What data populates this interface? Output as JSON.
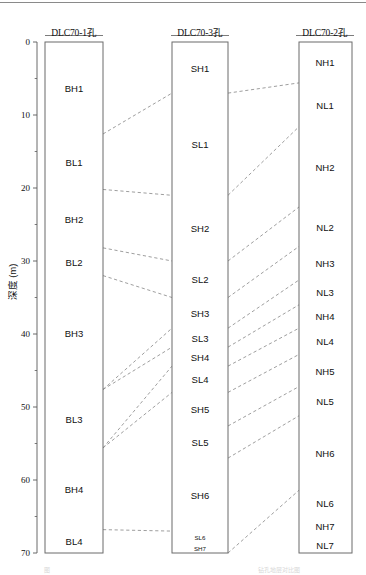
{
  "figure": {
    "title_fragment_left": "图",
    "title_fragment_right": "钻孔地层对比图",
    "axis_title": "深度 (m)",
    "line_color": "#5a5a5a",
    "box_color": "#6b6b6b",
    "dash_color": "#8c8c8c"
  },
  "axis": {
    "label": "深度 (m)",
    "min": 0,
    "max": 70,
    "major_ticks": [
      0,
      10,
      20,
      30,
      40,
      50,
      60,
      70
    ],
    "major_labels": [
      "0",
      "10",
      "20",
      "30",
      "40",
      "50",
      "60",
      "70"
    ],
    "minor_ticks": [
      5,
      15,
      25,
      35,
      45,
      55,
      65
    ]
  },
  "columns": [
    {
      "id": "dlc70-1",
      "header": "DLC70-1孔",
      "top_depth": 0,
      "bottom_depth": 70,
      "units": [
        {
          "name": "BH1",
          "top": 0.0,
          "bottom": 12.6
        },
        {
          "name": "BL1",
          "top": 12.6,
          "bottom": 20.2
        },
        {
          "name": "BH2",
          "top": 20.2,
          "bottom": 28.2
        },
        {
          "name": "BL2",
          "top": 28.2,
          "bottom": 32.0
        },
        {
          "name": "BH3",
          "top": 32.0,
          "bottom": 47.6
        },
        {
          "name": "BL3",
          "top": 47.6,
          "bottom": 55.6
        },
        {
          "name": "BH4",
          "top": 55.6,
          "bottom": 66.8
        },
        {
          "name": "BL4",
          "top": 66.8,
          "bottom": 70.0
        }
      ]
    },
    {
      "id": "dlc70-3",
      "header": "DLC70-3孔",
      "top_depth": 0,
      "bottom_depth": 70,
      "units": [
        {
          "name": "SH1",
          "top": 0.0,
          "bottom": 7.0
        },
        {
          "name": "SL1",
          "top": 7.0,
          "bottom": 21.0
        },
        {
          "name": "SH2",
          "top": 21.0,
          "bottom": 30.0
        },
        {
          "name": "SL2",
          "top": 30.0,
          "bottom": 35.0
        },
        {
          "name": "SH3",
          "top": 35.0,
          "bottom": 39.2
        },
        {
          "name": "SL3",
          "top": 39.2,
          "bottom": 41.8
        },
        {
          "name": "SH4",
          "top": 41.8,
          "bottom": 44.4
        },
        {
          "name": "SL4",
          "top": 44.4,
          "bottom": 48.0
        },
        {
          "name": "SH5",
          "top": 48.0,
          "bottom": 52.6
        },
        {
          "name": "SL5",
          "top": 52.6,
          "bottom": 57.0
        },
        {
          "name": "SH6",
          "top": 57.0,
          "bottom": 67.0
        },
        {
          "name": "SL6",
          "top": 67.0,
          "bottom": 68.6,
          "small": true
        },
        {
          "name": "SH7",
          "top": 68.6,
          "bottom": 70.0,
          "small": true
        }
      ]
    },
    {
      "id": "dlc70-2",
      "header": "DLC70-2孔",
      "top_depth": 0,
      "bottom_depth": 70,
      "units": [
        {
          "name": "NH1",
          "top": 0.0,
          "bottom": 5.6
        },
        {
          "name": "NL1",
          "top": 5.6,
          "bottom": 11.6
        },
        {
          "name": "NH2",
          "top": 11.6,
          "bottom": 22.6
        },
        {
          "name": "NL2",
          "top": 22.6,
          "bottom": 28.0
        },
        {
          "name": "NH3",
          "top": 28.0,
          "bottom": 32.6
        },
        {
          "name": "NL3",
          "top": 32.6,
          "bottom": 36.0
        },
        {
          "name": "NH4",
          "top": 36.0,
          "bottom": 39.2
        },
        {
          "name": "NL4",
          "top": 39.2,
          "bottom": 42.8
        },
        {
          "name": "NH5",
          "top": 42.8,
          "bottom": 47.2
        },
        {
          "name": "NL5",
          "top": 47.2,
          "bottom": 51.2
        },
        {
          "name": "NH6",
          "top": 51.2,
          "bottom": 61.4
        },
        {
          "name": "NL6",
          "top": 61.4,
          "bottom": 64.8
        },
        {
          "name": "NH7",
          "top": 64.8,
          "bottom": 67.8
        },
        {
          "name": "NL7",
          "top": 67.8,
          "bottom": 70.0
        }
      ]
    }
  ],
  "correlations_left_mid": [
    {
      "left_depth": 12.6,
      "mid_depth": 7.0
    },
    {
      "left_depth": 20.2,
      "mid_depth": 21.0
    },
    {
      "left_depth": 28.2,
      "mid_depth": 30.0
    },
    {
      "left_depth": 32.0,
      "mid_depth": 35.0
    },
    {
      "left_depth": 47.6,
      "mid_depth": 39.2
    },
    {
      "left_depth": 47.6,
      "mid_depth": 41.8
    },
    {
      "left_depth": 55.6,
      "mid_depth": 44.4
    },
    {
      "left_depth": 55.6,
      "mid_depth": 48.0
    },
    {
      "left_depth": 66.8,
      "mid_depth": 67.0
    }
  ],
  "correlations_mid_right": [
    {
      "mid_depth": 7.0,
      "right_depth": 5.6
    },
    {
      "mid_depth": 21.0,
      "right_depth": 11.6
    },
    {
      "mid_depth": 30.0,
      "right_depth": 22.6
    },
    {
      "mid_depth": 35.0,
      "right_depth": 28.0
    },
    {
      "mid_depth": 39.2,
      "right_depth": 32.6
    },
    {
      "mid_depth": 41.8,
      "right_depth": 36.0
    },
    {
      "mid_depth": 44.4,
      "right_depth": 39.2
    },
    {
      "mid_depth": 48.0,
      "right_depth": 42.8
    },
    {
      "mid_depth": 52.6,
      "right_depth": 47.2
    },
    {
      "mid_depth": 57.0,
      "right_depth": 51.2
    },
    {
      "mid_depth": 70.0,
      "right_depth": 61.4
    }
  ],
  "chart_data": {
    "type": "table",
    "ylabel": "深度 (m)",
    "ylim": [
      0,
      70
    ],
    "grid": false,
    "legend": "none",
    "boreholes": [
      "DLC70-1孔",
      "DLC70-3孔",
      "DLC70-2孔"
    ],
    "series": [
      {
        "name": "DLC70-1孔",
        "units": [
          "BH1",
          "BL1",
          "BH2",
          "BL2",
          "BH3",
          "BL3",
          "BH4",
          "BL4"
        ],
        "tops": [
          0.0,
          12.6,
          20.2,
          28.2,
          32.0,
          47.6,
          55.6,
          66.8
        ],
        "bottoms": [
          12.6,
          20.2,
          28.2,
          32.0,
          47.6,
          55.6,
          66.8,
          70.0
        ]
      },
      {
        "name": "DLC70-3孔",
        "units": [
          "SH1",
          "SL1",
          "SH2",
          "SL2",
          "SH3",
          "SL3",
          "SH4",
          "SL4",
          "SH5",
          "SL5",
          "SH6",
          "SL6",
          "SH7"
        ],
        "tops": [
          0.0,
          7.0,
          21.0,
          30.0,
          35.0,
          39.2,
          41.8,
          44.4,
          48.0,
          52.6,
          57.0,
          67.0,
          68.6
        ],
        "bottoms": [
          7.0,
          21.0,
          30.0,
          35.0,
          39.2,
          41.8,
          44.4,
          48.0,
          52.6,
          57.0,
          67.0,
          68.6,
          70.0
        ]
      },
      {
        "name": "DLC70-2孔",
        "units": [
          "NH1",
          "NL1",
          "NH2",
          "NL2",
          "NH3",
          "NL3",
          "NH4",
          "NL4",
          "NH5",
          "NL5",
          "NH6",
          "NL6",
          "NH7",
          "NL7"
        ],
        "tops": [
          0.0,
          5.6,
          11.6,
          22.6,
          28.0,
          32.6,
          36.0,
          39.2,
          42.8,
          47.2,
          51.2,
          61.4,
          64.8,
          67.8
        ],
        "bottoms": [
          5.6,
          11.6,
          22.6,
          28.0,
          32.6,
          36.0,
          39.2,
          42.8,
          47.2,
          51.2,
          61.4,
          64.8,
          67.8,
          70.0
        ]
      }
    ]
  }
}
